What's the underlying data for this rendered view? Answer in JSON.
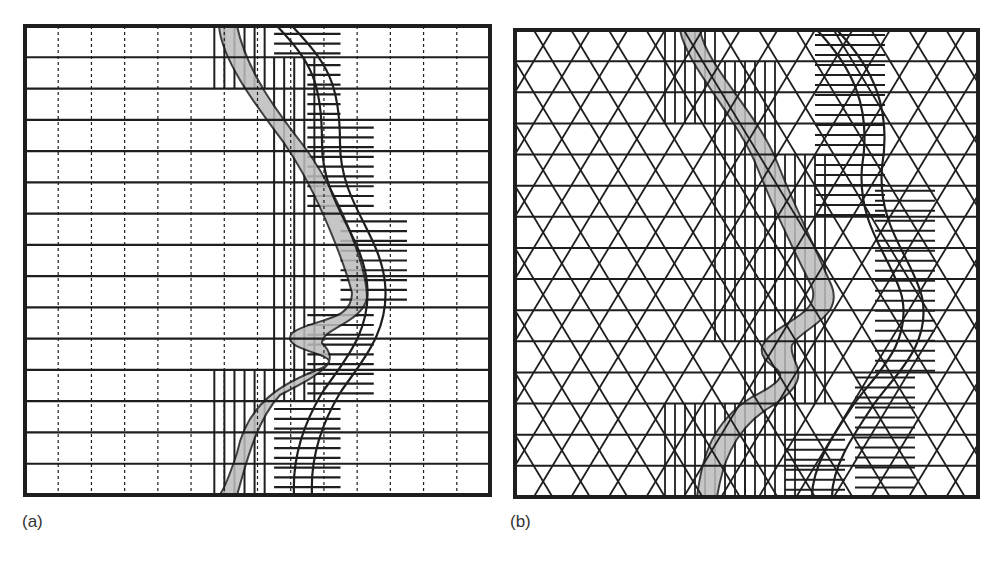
{
  "figure": {
    "panels": [
      {
        "id": "a",
        "label": "(a)",
        "grid_type": "rectangular",
        "description": "Rectangular grid with dashed vertical lines; shaded river channel and meander band overlaid with vertical and horizontal hatched cells"
      },
      {
        "id": "b",
        "label": "(b)",
        "grid_type": "triangular",
        "description": "Triangular lattice grid; shaded river channel and meander band overlaid with vertical and horizontal hatched triangular cells"
      }
    ],
    "colors": {
      "ink": "#1e1e1e",
      "shade": "#bdbdbd",
      "background": "#ffffff"
    }
  }
}
